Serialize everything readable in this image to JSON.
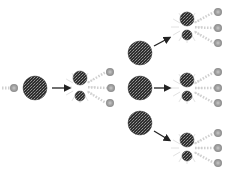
{
  "diagram": {
    "type": "nuclear-fission-chain-reaction",
    "colors": {
      "nucleus": "#3a3a3a",
      "fragment": "#2a2a2a",
      "neutron": "#9a9a9a",
      "arrow": "#222222",
      "burst": "#d8d8d8"
    },
    "incoming_neutron": {
      "x": 14,
      "y": 88,
      "r": 4
    },
    "initial_nucleus": {
      "x": 35,
      "y": 88,
      "r": 12
    },
    "arrows": [
      {
        "x1": 52,
        "y1": 88,
        "x2": 69,
        "y2": 88
      },
      {
        "x1": 154,
        "y1": 46,
        "x2": 169,
        "y2": 38
      },
      {
        "x1": 154,
        "y1": 88,
        "x2": 169,
        "y2": 88
      },
      {
        "x1": 154,
        "y1": 131,
        "x2": 169,
        "y2": 140
      }
    ],
    "first_split": {
      "fragments": [
        {
          "x": 80,
          "y": 78,
          "r": 7
        },
        {
          "x": 80,
          "y": 96,
          "r": 5
        }
      ],
      "neutrons": [
        {
          "x": 110,
          "y": 72,
          "r": 4
        },
        {
          "x": 111,
          "y": 88,
          "r": 4
        },
        {
          "x": 110,
          "y": 103,
          "r": 4
        }
      ]
    },
    "second_generation_nuclei": [
      {
        "x": 140,
        "y": 53,
        "r": 12
      },
      {
        "x": 140,
        "y": 88,
        "r": 12
      },
      {
        "x": 140,
        "y": 123,
        "r": 12
      }
    ],
    "second_splits": [
      {
        "fragments": [
          {
            "x": 187,
            "y": 19,
            "r": 7
          },
          {
            "x": 187,
            "y": 35,
            "r": 5
          }
        ],
        "neutrons": [
          {
            "x": 218,
            "y": 12,
            "r": 4
          },
          {
            "x": 218,
            "y": 28,
            "r": 4
          },
          {
            "x": 218,
            "y": 43,
            "r": 4
          }
        ]
      },
      {
        "fragments": [
          {
            "x": 187,
            "y": 80,
            "r": 7
          },
          {
            "x": 187,
            "y": 96,
            "r": 5
          }
        ],
        "neutrons": [
          {
            "x": 218,
            "y": 72,
            "r": 4
          },
          {
            "x": 218,
            "y": 88,
            "r": 4
          },
          {
            "x": 218,
            "y": 103,
            "r": 4
          }
        ]
      },
      {
        "fragments": [
          {
            "x": 187,
            "y": 140,
            "r": 7
          },
          {
            "x": 187,
            "y": 156,
            "r": 5
          }
        ],
        "neutrons": [
          {
            "x": 218,
            "y": 133,
            "r": 4
          },
          {
            "x": 218,
            "y": 148,
            "r": 4
          },
          {
            "x": 218,
            "y": 163,
            "r": 4
          }
        ]
      }
    ]
  }
}
